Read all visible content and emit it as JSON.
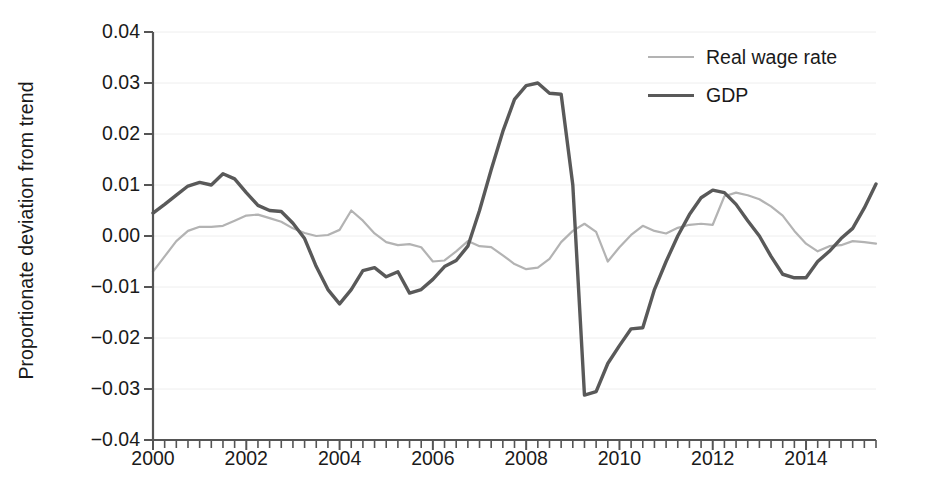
{
  "chart_data": {
    "type": "line",
    "title": "",
    "xlabel": "",
    "ylabel": "Proportionate deviation from trend",
    "xlim": [
      2000.0,
      2015.5
    ],
    "ylim": [
      -0.04,
      0.04
    ],
    "grid": true,
    "grid_axis": "y",
    "legend_position": "top-right",
    "x_tick_labels": [
      "2000",
      "2002",
      "2004",
      "2006",
      "2008",
      "2010",
      "2012",
      "2014"
    ],
    "x_tick_values": [
      2000,
      2002,
      2004,
      2006,
      2008,
      2010,
      2012,
      2014
    ],
    "x_minor_tick_step": 0.25,
    "y_tick_labels": [
      "0.04",
      "0.03",
      "0.02",
      "0.01",
      "0.00",
      "−0.01",
      "−0.02",
      "−0.03",
      "−0.04"
    ],
    "y_tick_values": [
      0.04,
      0.03,
      0.02,
      0.01,
      0.0,
      -0.01,
      -0.02,
      -0.03,
      -0.04
    ],
    "x": [
      2000.0,
      2000.25,
      2000.5,
      2000.75,
      2001.0,
      2001.25,
      2001.5,
      2001.75,
      2002.0,
      2002.25,
      2002.5,
      2002.75,
      2003.0,
      2003.25,
      2003.5,
      2003.75,
      2004.0,
      2004.25,
      2004.5,
      2004.75,
      2005.0,
      2005.25,
      2005.5,
      2005.75,
      2006.0,
      2006.25,
      2006.5,
      2006.75,
      2007.0,
      2007.25,
      2007.5,
      2007.75,
      2008.0,
      2008.25,
      2008.5,
      2008.75,
      2009.0,
      2009.25,
      2009.5,
      2009.75,
      2010.0,
      2010.25,
      2010.5,
      2010.75,
      2011.0,
      2011.25,
      2011.5,
      2011.75,
      2012.0,
      2012.25,
      2012.5,
      2012.75,
      2013.0,
      2013.25,
      2013.5,
      2013.75,
      2014.0,
      2014.25,
      2014.5,
      2014.75,
      2015.0,
      2015.25,
      2015.5
    ],
    "series": [
      {
        "name": "Real wage rate",
        "color": "#b3b3b3",
        "values": [
          -0.007,
          -0.004,
          -0.001,
          0.001,
          0.0018,
          0.0018,
          0.002,
          0.003,
          0.004,
          0.0042,
          0.0035,
          0.0028,
          0.0015,
          0.0006,
          0.0,
          0.0002,
          0.0012,
          0.005,
          0.003,
          0.0005,
          -0.0012,
          -0.0018,
          -0.0016,
          -0.0022,
          -0.005,
          -0.0048,
          -0.003,
          -0.001,
          -0.002,
          -0.0022,
          -0.0038,
          -0.0055,
          -0.0065,
          -0.0062,
          -0.0045,
          -0.0012,
          0.001,
          0.0024,
          0.0008,
          -0.005,
          -0.0022,
          0.0002,
          0.002,
          0.001,
          0.0005,
          0.0016,
          0.0022,
          0.0024,
          0.0022,
          0.0078,
          0.0085,
          0.008,
          0.0072,
          0.0058,
          0.004,
          0.001,
          -0.0015,
          -0.003,
          -0.002,
          -0.0018,
          -0.001,
          -0.0012,
          -0.0015
        ]
      },
      {
        "name": "GDP",
        "color": "#595959",
        "values": [
          0.0045,
          0.0062,
          0.008,
          0.0098,
          0.0105,
          0.01,
          0.0122,
          0.0112,
          0.0085,
          0.006,
          0.005,
          0.0048,
          0.0025,
          -0.0005,
          -0.006,
          -0.0105,
          -0.0133,
          -0.0105,
          -0.0068,
          -0.0062,
          -0.008,
          -0.007,
          -0.0112,
          -0.0105,
          -0.0085,
          -0.006,
          -0.0048,
          -0.002,
          0.005,
          0.013,
          0.0205,
          0.0268,
          0.0295,
          0.03,
          0.028,
          0.0278,
          0.01,
          -0.0312,
          -0.0305,
          -0.025,
          -0.0215,
          -0.0182,
          -0.018,
          -0.0105,
          -0.005,
          0.0,
          0.0042,
          0.0075,
          0.009,
          0.0085,
          0.0062,
          0.003,
          0.0,
          -0.004,
          -0.0075,
          -0.0082,
          -0.0082,
          -0.005,
          -0.003,
          -0.0005,
          0.0015,
          0.0055,
          0.0102
        ]
      }
    ]
  },
  "legend": {
    "items": [
      {
        "label": "Real wage rate",
        "color": "#b3b3b3",
        "line_width": "2.2px"
      },
      {
        "label": "GDP",
        "color": "#595959",
        "line_width": "3.6px"
      }
    ]
  },
  "axis": {
    "y_axis_title": "Proportionate deviation from trend"
  },
  "colors": {
    "background": "#ffffff",
    "axis": "#555555",
    "gridline": "#eeeeee",
    "text": "#1a1a1a",
    "real_wage_rate": "#b3b3b3",
    "gdp": "#595959"
  }
}
